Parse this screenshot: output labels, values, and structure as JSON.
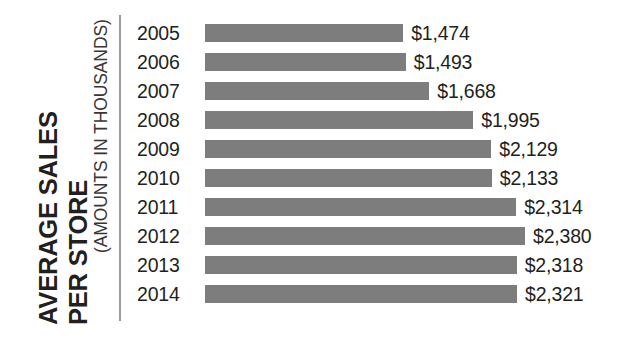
{
  "chart_data": {
    "type": "bar",
    "orientation": "horizontal",
    "title": "AVERAGE SALES PER STORE",
    "title_lines": [
      "AVERAGE SALES",
      "PER STORE"
    ],
    "subtitle": "(AMOUNTS IN THOUSANDS)",
    "xlabel": "",
    "ylabel": "AVERAGE SALES PER STORE",
    "categories": [
      "2005",
      "2006",
      "2007",
      "2008",
      "2009",
      "2010",
      "2011",
      "2012",
      "2013",
      "2014"
    ],
    "values": [
      1474,
      1493,
      1668,
      1995,
      2129,
      2133,
      2314,
      2380,
      2318,
      2321
    ],
    "data_labels": [
      "$1,474",
      "$1,493",
      "$1,668",
      "$1,995",
      "$2,129",
      "$2,133",
      "$2,314",
      "$2,380",
      "$2,318",
      "$2,321"
    ],
    "xlim": [
      0,
      2380
    ],
    "grid": false,
    "legend": false,
    "bar_color": "#7d7d7d",
    "text_color": "#231f20",
    "axis_color": "#9a9a9a",
    "background": "#ffffff"
  },
  "rows": [
    {
      "year": "2005",
      "value": 1474,
      "label": "$1,474"
    },
    {
      "year": "2006",
      "value": 1493,
      "label": "$1,493"
    },
    {
      "year": "2007",
      "value": 1668,
      "label": "$1,668"
    },
    {
      "year": "2008",
      "value": 1995,
      "label": "$1,995"
    },
    {
      "year": "2009",
      "value": 2129,
      "label": "$2,129"
    },
    {
      "year": "2010",
      "value": 2133,
      "label": "$2,133"
    },
    {
      "year": "2011",
      "value": 2314,
      "label": "$2,314"
    },
    {
      "year": "2012",
      "value": 2380,
      "label": "$2,380"
    },
    {
      "year": "2013",
      "value": 2318,
      "label": "$2,318"
    },
    {
      "year": "2014",
      "value": 2321,
      "label": "$2,321"
    }
  ]
}
